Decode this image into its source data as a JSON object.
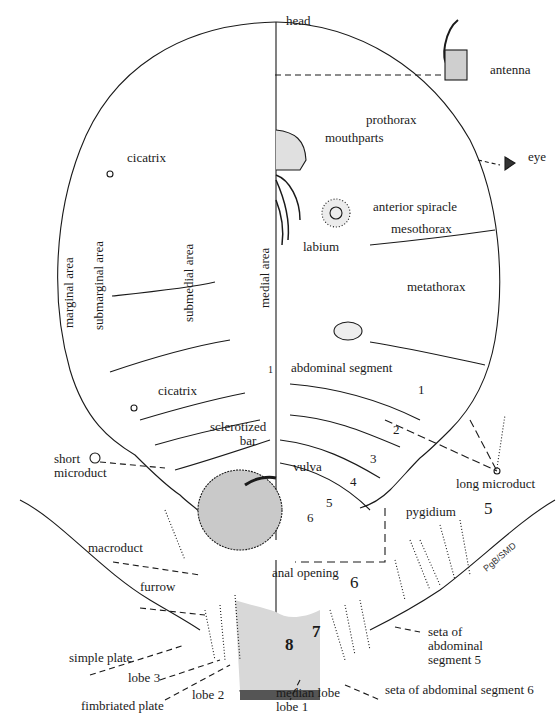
{
  "figure": {
    "signature": "PgB/SMD",
    "labels": {
      "head": "head",
      "antenna": "antenna",
      "prothorax": "prothorax",
      "mouthparts": "mouthparts",
      "eye": "eye",
      "cicatrix_upper": "cicatrix",
      "anterior_spiracle": "anterior spiracle",
      "labium": "labium",
      "mesothorax": "mesothorax",
      "marginal_area": "marginal area",
      "submarginal_area": "submarginal area",
      "submedial_area": "submedial area",
      "medial_area": "medial area",
      "metathorax": "metathorax",
      "abdominal_segment": "abdominal segment",
      "cicatrix_lower": "cicatrix",
      "sclerotized_bar_line1": "sclerotized",
      "sclerotized_bar_line2": "bar",
      "short_microduct_line1": "short",
      "short_microduct_line2": "microduct",
      "vulva": "vulva",
      "long_microduct": "long microduct",
      "pygidium": "pygidium",
      "macroduct": "macroduct",
      "anal_opening": "anal opening",
      "furrow": "furrow",
      "seta_seg5_line1": "seta of",
      "seta_seg5_line2": "abdominal",
      "seta_seg5_line3": "segment 5",
      "simple_plate": "simple plate",
      "lobe_3": "lobe 3",
      "lobe_2": "lobe 2",
      "median_lobe_line1": "median lobe",
      "median_lobe_line2": "lobe 1",
      "fimbriated_plate": "fimbriated plate",
      "seta_seg6": "seta of abdominal segment 6"
    },
    "segment_numbers": {
      "medial_1": "1",
      "seg1": "1",
      "seg2": "2",
      "seg3": "3",
      "seg4": "4",
      "seg5_small": "5",
      "seg6_small": "6",
      "pyg5": "5",
      "pyg6": "6",
      "pyg7": "7",
      "pyg8": "8"
    }
  }
}
